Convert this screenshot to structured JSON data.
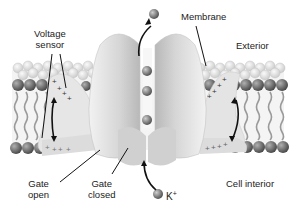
{
  "labels": {
    "voltage_sensor_line1": "Voltage",
    "voltage_sensor_line2": "sensor",
    "membrane": "Membrane",
    "exterior": "Exterior",
    "gate_open_line1": "Gate",
    "gate_open_line2": "open",
    "gate_closed_line1": "Gate",
    "gate_closed_line2": "closed",
    "cell_interior": "Cell interior",
    "ion": "K",
    "ion_charge": "+"
  },
  "colors": {
    "protein": "#d9d9d9",
    "protein_shade": "#bdbdbd",
    "head_top": "#e4e4e4",
    "head_bottom": "#6a6a6a",
    "tail": "#9a9a9a",
    "ion": "#707070",
    "text": "#222222"
  }
}
